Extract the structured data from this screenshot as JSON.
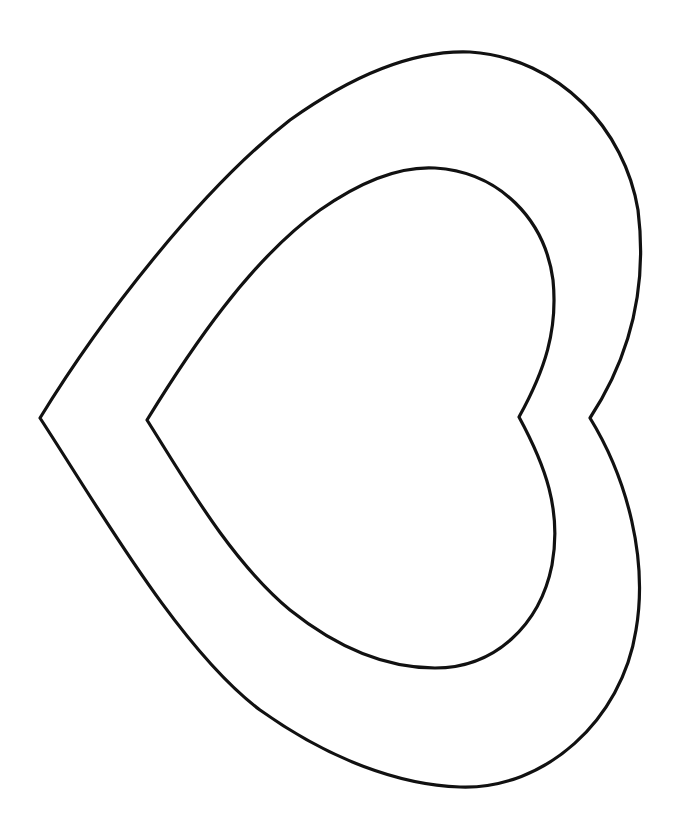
{
  "drawing": {
    "title": "Double heart outline",
    "background": "#ffffff",
    "stroke_color": "#111111",
    "shapes": [
      {
        "name": "outer-heart",
        "orientation": "rotated, point facing left"
      },
      {
        "name": "inner-heart",
        "orientation": "rotated, point facing left"
      }
    ]
  }
}
